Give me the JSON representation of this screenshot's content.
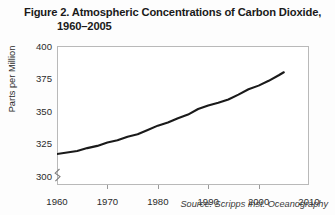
{
  "figure": {
    "title_line_1": "Figure 2. Atmospheric Concentrations of Carbon Dioxide,",
    "title_line_2": "1960–2005",
    "source_note": "Source: Scripps Inst. Oceanography"
  },
  "colors": {
    "line": "#1a1a1a",
    "frame": "#b9b9b9",
    "tick": "#9a9a9a",
    "text": "#2b2b2b",
    "background": "#fdfdfd",
    "plot_background": "#ffffff"
  },
  "chart_data": {
    "type": "line",
    "title": "Figure 2. Atmospheric Concentrations of Carbon Dioxide, 1960–2005",
    "xlabel": "",
    "ylabel": "Parts per Million",
    "source": "Source: Scripps Inst. Oceanography",
    "xlim": [
      1960,
      2010
    ],
    "ylim": [
      293,
      400
    ],
    "y_axis_break": true,
    "grid": false,
    "legend": false,
    "xticks": [
      1960,
      1970,
      1980,
      1990,
      2000,
      2010
    ],
    "xtick_labels": [
      "1960",
      "1970",
      "1980",
      "1990",
      "2000",
      "2010"
    ],
    "yticks": [
      300,
      325,
      350,
      375,
      400
    ],
    "ytick_labels": [
      "300",
      "325",
      "350",
      "375",
      "400"
    ],
    "series": [
      {
        "name": "Atmospheric CO2 concentration",
        "x": [
          1960,
          1962,
          1964,
          1966,
          1968,
          1970,
          1972,
          1974,
          1976,
          1978,
          1980,
          1982,
          1984,
          1986,
          1988,
          1990,
          1992,
          1994,
          1996,
          1998,
          2000,
          2002,
          2004,
          2005
        ],
        "values": [
          316.9,
          318.0,
          319.2,
          321.4,
          323.1,
          325.7,
          327.4,
          330.2,
          332.1,
          335.4,
          338.7,
          341.1,
          344.4,
          347.2,
          351.5,
          354.2,
          356.3,
          358.8,
          362.6,
          366.7,
          369.5,
          373.2,
          377.5,
          379.8
        ]
      }
    ]
  }
}
